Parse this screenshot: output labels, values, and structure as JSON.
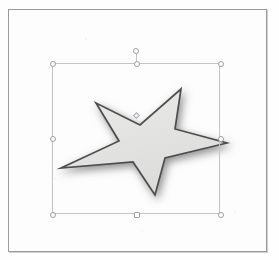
{
  "canvas": {
    "background_color": "#fdfdfd",
    "border_color": "#9a9a9a",
    "width": 259,
    "height": 243
  },
  "shape": {
    "name": "5-Point Star",
    "type": "star",
    "points": 5,
    "fill_color": "#e4e4e2",
    "outline_color": "#4a4a4a",
    "outline_width": 1.6,
    "shadow_color": "#8c8c8c",
    "shadow_blur": 6,
    "shadow_offset_x": 2,
    "shadow_offset_y": 3,
    "rotation_degrees": -16,
    "vertical_scale_percent": 72,
    "selected": true
  },
  "selection": {
    "box_color": "#c2c4c8",
    "handle_fill": "#ffffff",
    "handle_border": "#9b9ea3",
    "left": 43,
    "top": 53,
    "width": 168,
    "height": 151,
    "handles": [
      {
        "name": "handle-top-left",
        "x": 0,
        "y": 0,
        "cursor": "nw-resize"
      },
      {
        "name": "handle-top-center",
        "x": 84,
        "y": 0,
        "cursor": "n-resize"
      },
      {
        "name": "handle-top-right",
        "x": 168,
        "y": 0,
        "cursor": "ne-resize"
      },
      {
        "name": "handle-middle-left",
        "x": 0,
        "y": 75,
        "cursor": "w-resize"
      },
      {
        "name": "handle-middle-right",
        "x": 168,
        "y": 75,
        "cursor": "e-resize"
      },
      {
        "name": "handle-bottom-left",
        "x": 0,
        "y": 151,
        "cursor": "sw-resize"
      },
      {
        "name": "handle-bottom-center",
        "x": 84,
        "y": 151,
        "cursor": "s-resize"
      },
      {
        "name": "handle-bottom-right",
        "x": 168,
        "y": 151,
        "cursor": "se-resize"
      }
    ],
    "rotation_handle": {
      "name": "rotation-handle",
      "x": 127,
      "y": 41
    },
    "adjustment_handle": {
      "name": "adjustment-handle",
      "x": 127,
      "y": 105
    }
  }
}
